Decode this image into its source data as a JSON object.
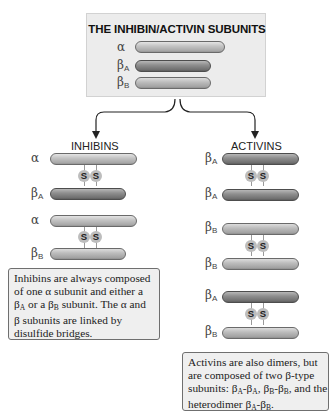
{
  "top_box": {
    "title": "THE INHIBIN/ACTIVIN SUBUNITS",
    "subunits": [
      {
        "symbol": "α",
        "sub": "",
        "type": "alpha"
      },
      {
        "symbol": "β",
        "sub": "A",
        "type": "betaA"
      },
      {
        "symbol": "β",
        "sub": "B",
        "type": "betaB"
      }
    ]
  },
  "inhibins": {
    "heading": "INHIBINS",
    "dimers": [
      {
        "top": {
          "symbol": "α",
          "sub": ""
        },
        "bottom": {
          "symbol": "β",
          "sub": "A"
        }
      },
      {
        "top": {
          "symbol": "α",
          "sub": ""
        },
        "bottom": {
          "symbol": "β",
          "sub": "B"
        }
      }
    ],
    "bond_label": "S",
    "note": {
      "line1": "Inhibins are always composed",
      "line2": "of one α subunit and either a",
      "line3_pre": "β",
      "line3_sub1": "A",
      "line3_mid": " or a β",
      "line3_sub2": "B",
      "line3_post": " subunit. The α and",
      "line4": "β subunits are linked by",
      "line5": "disulfide bridges."
    }
  },
  "activins": {
    "heading": "ACTIVINS",
    "dimers": [
      {
        "top": {
          "symbol": "β",
          "sub": "A"
        },
        "bottom": {
          "symbol": "β",
          "sub": "A"
        }
      },
      {
        "top": {
          "symbol": "β",
          "sub": "B"
        },
        "bottom": {
          "symbol": "β",
          "sub": "B"
        }
      },
      {
        "top": {
          "symbol": "β",
          "sub": "A"
        },
        "bottom": {
          "symbol": "β",
          "sub": "B"
        }
      }
    ],
    "bond_label": "S",
    "note": {
      "line1": "Activins are also dimers, but",
      "line2": "are composed of two β-type",
      "line3": "subunits: β",
      "s1": "A",
      "t1": "-β",
      "s2": "A",
      "t2": ", β",
      "s3": "B",
      "t3": "-β",
      "s4": "B",
      "t4": ", and the",
      "line4": "heterodimer β",
      "s5": "A",
      "t5": "-β",
      "s6": "B",
      "t6": "."
    }
  },
  "colors": {
    "alpha_bar": "#c0c0c0",
    "betaA_bar": "#808080",
    "betaB_bar": "#b5b5b5",
    "box_bg": "#ececec",
    "arrow": "#222222"
  }
}
